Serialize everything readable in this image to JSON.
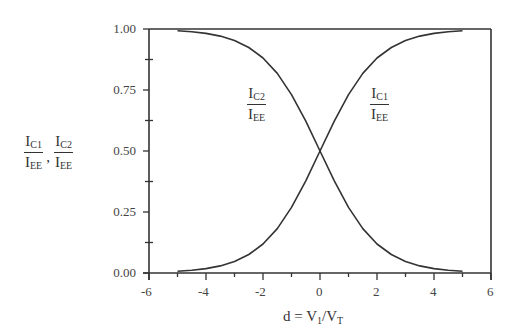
{
  "chart_data": {
    "type": "line",
    "title": "",
    "xlabel": "d = V1/VT",
    "ylabel": "IC1/IEE, IC2/IEE",
    "xlim": [
      -6,
      6
    ],
    "ylim": [
      0,
      1
    ],
    "x_ticks": [
      "-6",
      "-4",
      "-2",
      "0",
      "2",
      "4",
      "6"
    ],
    "y_ticks": [
      "0.00",
      "0.25",
      "0.50",
      "0.75",
      "1.00"
    ],
    "grid": false,
    "legend": "inline labels",
    "x": [
      -5,
      -4.5,
      -4,
      -3.5,
      -3,
      -2.5,
      -2,
      -1.5,
      -1,
      -0.5,
      0,
      0.5,
      1,
      1.5,
      2,
      2.5,
      3,
      3.5,
      4,
      4.5,
      5
    ],
    "series": [
      {
        "name": "IC1/IEE",
        "values": [
          0.007,
          0.011,
          0.018,
          0.029,
          0.047,
          0.076,
          0.119,
          0.182,
          0.269,
          0.378,
          0.5,
          0.622,
          0.731,
          0.818,
          0.881,
          0.924,
          0.953,
          0.971,
          0.982,
          0.989,
          0.993
        ]
      },
      {
        "name": "IC2/IEE",
        "values": [
          0.993,
          0.989,
          0.982,
          0.971,
          0.953,
          0.924,
          0.881,
          0.818,
          0.731,
          0.622,
          0.5,
          0.378,
          0.269,
          0.182,
          0.119,
          0.076,
          0.047,
          0.029,
          0.018,
          0.011,
          0.007
        ]
      }
    ],
    "annotations": [
      {
        "text": "IC2/IEE",
        "x": -2.5,
        "y": 0.72
      },
      {
        "text": "IC1/IEE",
        "x": 2.5,
        "y": 0.72
      }
    ]
  },
  "labels": {
    "y_axis": {
      "num1": "I",
      "num1_sub": "C1",
      "den1": "I",
      "den1_sub": "EE",
      "sep": ",",
      "num2": "I",
      "num2_sub": "C2",
      "den2": "I",
      "den2_sub": "EE"
    },
    "x_axis": {
      "pre": "d = V",
      "sub1": "1",
      "mid": "/V",
      "sub2": "T"
    },
    "curve_c2": {
      "num": "I",
      "num_sub": "C2",
      "den": "I",
      "den_sub": "EE"
    },
    "curve_c1": {
      "num": "I",
      "num_sub": "C1",
      "den": "I",
      "den_sub": "EE"
    }
  },
  "colors": {
    "line": "#333333",
    "axis": "#333333",
    "text": "#444444"
  }
}
